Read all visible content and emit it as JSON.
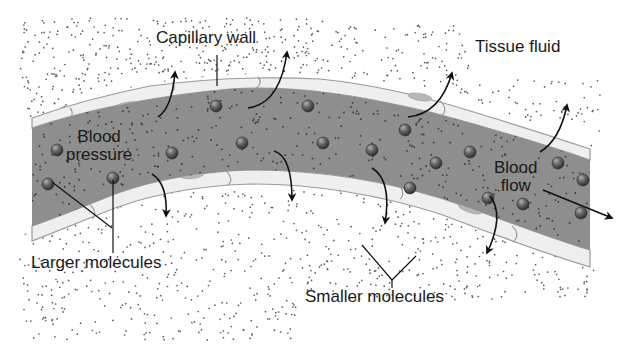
{
  "diagram": {
    "colors": {
      "background": "#ffffff",
      "lumen": "#8e8e8e",
      "wall": "#ededed",
      "wall_edge": "#9a9a9a",
      "nucleus": "#b5b5b5",
      "molecule_large": "#5a5a5a",
      "dot": "#555555",
      "arrow": "#111111",
      "text": "#1a1a1a"
    },
    "labels": {
      "capillary_wall": "Capillary wall",
      "tissue_fluid": "Tissue fluid",
      "blood_pressure": [
        "Blood",
        "pressure"
      ],
      "blood_flow": [
        "Blood",
        "flow"
      ],
      "larger_molecules": "Larger molecules",
      "smaller_molecules": "Smaller molecules"
    },
    "large_molecules": [
      [
        57,
        150
      ],
      [
        113,
        178
      ],
      [
        48,
        184
      ],
      [
        172,
        153
      ],
      [
        216,
        106
      ],
      [
        242,
        143
      ],
      [
        308,
        106
      ],
      [
        323,
        143
      ],
      [
        372,
        150
      ],
      [
        405,
        130
      ],
      [
        436,
        163
      ],
      [
        470,
        152
      ],
      [
        410,
        188
      ],
      [
        488,
        198
      ],
      [
        558,
        163
      ],
      [
        583,
        180
      ],
      [
        523,
        204
      ],
      [
        581,
        213
      ]
    ],
    "outflow_arrows_up": [
      {
        "from": [
          158,
          117
        ],
        "c1": [
          172,
          108
        ],
        "to": [
          175,
          72
        ]
      },
      {
        "from": [
          248,
          108
        ],
        "c1": [
          280,
          104
        ],
        "to": [
          287,
          52
        ]
      },
      {
        "from": [
          408,
          117
        ],
        "c1": [
          440,
          114
        ],
        "to": [
          452,
          73
        ]
      },
      {
        "from": [
          540,
          152
        ],
        "c1": [
          560,
          140
        ],
        "to": [
          567,
          105
        ]
      }
    ],
    "outflow_arrows_down": [
      {
        "from": [
          152,
          174
        ],
        "c1": [
          168,
          184
        ],
        "to": [
          166,
          216
        ]
      },
      {
        "from": [
          274,
          151
        ],
        "c1": [
          292,
          156
        ],
        "to": [
          292,
          200
        ]
      },
      {
        "from": [
          372,
          168
        ],
        "c1": [
          392,
          180
        ],
        "to": [
          385,
          223
        ]
      },
      {
        "from": [
          490,
          196
        ],
        "c1": [
          505,
          215
        ],
        "to": [
          487,
          253
        ]
      }
    ],
    "flow_arrow": {
      "from": [
        543,
        190
      ],
      "to": [
        612,
        218
      ]
    }
  }
}
